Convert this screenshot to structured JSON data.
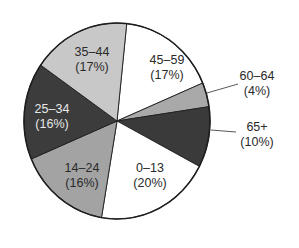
{
  "chart_data": {
    "type": "pie",
    "title": "",
    "start_angle_deg": 6,
    "direction": "clockwise",
    "slices": [
      {
        "label": "45–59",
        "pct_label": "(17%)",
        "value": 17,
        "color": "#ffffff",
        "text_color": "#2a2a2a"
      },
      {
        "label": "60–64",
        "pct_label": "(4%)",
        "value": 4,
        "color": "#a9a9a9",
        "text_color": "#2a2a2a",
        "outside": true
      },
      {
        "label": "65+",
        "pct_label": "(10%)",
        "value": 10,
        "color": "#3a3a3a",
        "text_color": "#2a2a2a",
        "outside": true
      },
      {
        "label": "0–13",
        "pct_label": "(20%)",
        "value": 20,
        "color": "#ffffff",
        "text_color": "#2a2a2a"
      },
      {
        "label": "14–24",
        "pct_label": "(16%)",
        "value": 16,
        "color": "#a3a3a3",
        "text_color": "#2a2a2a"
      },
      {
        "label": "25–34",
        "pct_label": "(16%)",
        "value": 16,
        "color": "#3c3c3c",
        "text_color": "#e8e8e8"
      },
      {
        "label": "35–44",
        "pct_label": "(17%)",
        "value": 17,
        "color": "#c8c8c8",
        "text_color": "#2a2a2a"
      }
    ],
    "categories": [
      "45–59",
      "60–64",
      "65+",
      "0–13",
      "14–24",
      "25–34",
      "35–44"
    ],
    "values": [
      17,
      4,
      10,
      20,
      16,
      16,
      17
    ],
    "legend": "none (direct labels)"
  },
  "labels": {
    "s0": {
      "name": "45–59",
      "pct": "(17%)"
    },
    "s1": {
      "name": "60–64",
      "pct": "(4%)"
    },
    "s2": {
      "name": "65+",
      "pct": "(10%)"
    },
    "s3": {
      "name": "0–13",
      "pct": "(20%)"
    },
    "s4": {
      "name": "14–24",
      "pct": "(16%)"
    },
    "s5": {
      "name": "25–34",
      "pct": "(16%)"
    },
    "s6": {
      "name": "35–44",
      "pct": "(17%)"
    }
  }
}
